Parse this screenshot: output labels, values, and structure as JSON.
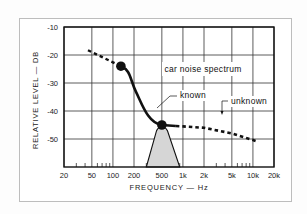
{
  "chart_data": {
    "type": "line",
    "title": "",
    "xlabel": "FREQUENCY — Hz",
    "ylabel": "RELATIVE LEVEL — DB",
    "x_scale": "log",
    "xlim": [
      20,
      20000
    ],
    "ylim": [
      -60,
      -10
    ],
    "grid": true,
    "x_ticks": [
      {
        "value": 20,
        "label": "20"
      },
      {
        "value": 50,
        "label": "50"
      },
      {
        "value": 100,
        "label": "100"
      },
      {
        "value": 200,
        "label": "200"
      },
      {
        "value": 500,
        "label": "500"
      },
      {
        "value": 1000,
        "label": "1k"
      },
      {
        "value": 2000,
        "label": "2k"
      },
      {
        "value": 5000,
        "label": "5k"
      },
      {
        "value": 10000,
        "label": "10k"
      },
      {
        "value": 20000,
        "label": "20k"
      }
    ],
    "y_ticks": [
      {
        "value": -10,
        "label": "-10"
      },
      {
        "value": -20,
        "label": "-20"
      },
      {
        "value": -30,
        "label": "-30"
      },
      {
        "value": -40,
        "label": "-40"
      },
      {
        "value": -50,
        "label": "-50"
      }
    ],
    "series": [
      {
        "name": "unknown (low)",
        "style": "dashed",
        "x": [
          44,
          130
        ],
        "y": [
          -18.3,
          -24
        ]
      },
      {
        "name": "known",
        "style": "solid",
        "x": [
          130,
          200,
          300,
          500
        ],
        "y": [
          -24,
          -31,
          -40,
          -45
        ]
      },
      {
        "name": "unknown (high)",
        "style": "dashed",
        "x": [
          500,
          1000,
          2000,
          5000,
          12000
        ],
        "y": [
          -45,
          -45.5,
          -46,
          -48,
          -51
        ]
      },
      {
        "name": "band-pass filter",
        "style": "filled",
        "x": [
          300,
          420,
          500,
          600,
          900
        ],
        "y": [
          -60,
          -47,
          -45,
          -47,
          -60
        ]
      }
    ],
    "markers": [
      {
        "x": 130,
        "y": -24
      },
      {
        "x": 500,
        "y": -45
      }
    ],
    "annotations": [
      {
        "text": "car noise spectrum",
        "x": 1100,
        "y": -25
      },
      {
        "text": "known",
        "x": 1300,
        "y": -34
      },
      {
        "text": "unknown",
        "x": 7000,
        "y": -36
      }
    ]
  },
  "labels": {
    "annotation_spectrum": "car noise spectrum",
    "annotation_known": "known",
    "annotation_unknown": "unknown",
    "x_axis": "FREQUENCY — Hz",
    "y_axis": "RELATIVE LEVEL — DB"
  },
  "colors": {
    "line": "#111111",
    "grid": "#333333",
    "band_fill": "#d6d6d6"
  }
}
